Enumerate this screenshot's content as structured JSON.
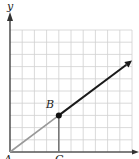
{
  "diagram": {
    "type": "coordinate-grid",
    "axes": {
      "y_label": "y",
      "x_label": ""
    },
    "grid": {
      "origin_px": [
        10,
        152
      ],
      "cell_px": 12.2,
      "columns": 10,
      "rows": 10,
      "line_color": "#d0d0d0",
      "axis_color": "#333333"
    },
    "points": [
      {
        "id": "A",
        "label": "A",
        "grid": [
          0,
          0
        ]
      },
      {
        "id": "B",
        "label": "B",
        "grid": [
          4,
          3
        ]
      },
      {
        "id": "C",
        "label": "C",
        "grid": [
          4,
          0
        ]
      }
    ],
    "segments": [
      {
        "name": "segment-AB",
        "from": "A",
        "to": "B",
        "color": "#999999"
      },
      {
        "name": "segment-BC",
        "from": "B",
        "to": "C",
        "color": "#777777"
      }
    ],
    "ray": {
      "name": "ray-from-B",
      "from": "B",
      "to_grid": [
        10,
        7.5
      ],
      "color": "#1a1a1a"
    }
  }
}
